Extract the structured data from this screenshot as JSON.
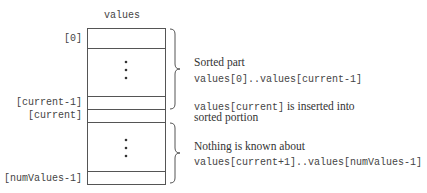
{
  "array": {
    "title": "values",
    "indices": {
      "first": "[0]",
      "current_minus_1": "[current-1]",
      "current": "[current]",
      "last": "[numValues-1]"
    },
    "ellipsis": "⋮"
  },
  "annotations": {
    "sorted": {
      "heading": "Sorted part",
      "range": "values[0]..values[current-1]"
    },
    "inserted": {
      "code": "values[current]",
      "text_1": " is inserted into",
      "text_2": "sorted portion"
    },
    "unknown": {
      "heading": "Nothing is known about",
      "range": "values[current+1]..values[numValues-1]"
    }
  },
  "colors": {
    "line": "#555555",
    "text": "#333333"
  }
}
